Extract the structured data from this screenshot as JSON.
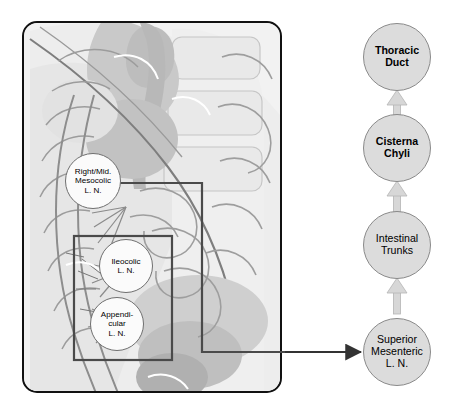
{
  "figure": {
    "type": "anatomical-flow-diagram"
  },
  "anatomy_panel": {
    "name": "abdominal-anatomy-illustration",
    "region_box_label": "ileocolic-appendicular-region",
    "nodes": [
      {
        "id": "right-mid-mesocolic",
        "lines": [
          "Right/Mid.",
          "Mesocolic",
          "L. N."
        ],
        "cx": 93,
        "cy": 181,
        "r": 28
      },
      {
        "id": "ileocolic",
        "lines": [
          "Ileocolic",
          "L. N."
        ],
        "cx": 126,
        "cy": 266,
        "r": 27
      },
      {
        "id": "appendicular",
        "lines": [
          "Appendi-",
          "cular",
          "L. N."
        ],
        "cx": 117,
        "cy": 324,
        "r": 27
      }
    ]
  },
  "flow_column": {
    "nodes": [
      {
        "id": "thoracic-duct",
        "lines": [
          "Thoracic",
          "Duct"
        ],
        "cx": 397,
        "cy": 57,
        "r": 34,
        "bold": true
      },
      {
        "id": "cisterna-chyli",
        "lines": [
          "Cisterna",
          "Chyli"
        ],
        "cx": 397,
        "cy": 148,
        "r": 34,
        "bold": true
      },
      {
        "id": "intestinal-trunks",
        "lines": [
          "Intestinal",
          "Trunks"
        ],
        "cx": 397,
        "cy": 245,
        "r": 34,
        "bold": false
      },
      {
        "id": "superior-mesenteric",
        "lines": [
          "Superior",
          "Mesenteric",
          "L. N."
        ],
        "cx": 397,
        "cy": 352,
        "r": 34,
        "bold": false
      }
    ]
  },
  "connectors": {
    "flow_arrow_color": "#d7d7d7",
    "flow_arrow_outline": "#aaaaaa",
    "link_arrow_color": "#333333",
    "panel_line_color": "#4a4a4a",
    "box_color": "#4a4a4a"
  },
  "colors": {
    "panel_border": "#111111",
    "node_flow_fill": "#dcdcdc",
    "node_flow_border": "#8a8a8a",
    "node_anat_fill": "#fbfbfb",
    "node_anat_border": "#6f6f6f",
    "background": "#ffffff"
  }
}
